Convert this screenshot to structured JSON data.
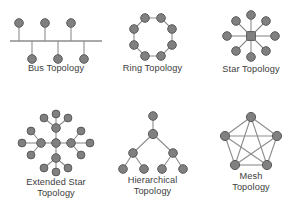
{
  "figure": {
    "background_color": "#ffffff",
    "node_fill": "#808080",
    "node_stroke": "#5a5a5a",
    "edge_color": "#8d8d8d",
    "text_color": "#3d3d3d"
  },
  "topologies": [
    {
      "id": "bus",
      "label": "Bus Topology",
      "node_count": 6,
      "description": "Six nodes attached by short stubs to a single horizontal backbone line, three above and three below.",
      "nodes_above": 3,
      "nodes_below": 3
    },
    {
      "id": "ring",
      "label": "Ring Topology",
      "node_count": 8,
      "description": "Eight nodes arranged in a closed octagonal ring, each connected to its two neighbours.",
      "edge_count": 8
    },
    {
      "id": "star",
      "label": "Star Topology",
      "node_count": 9,
      "description": "One central hub node connected by eight spokes to eight surrounding nodes.",
      "spokes": 8,
      "hub_count": 1
    },
    {
      "id": "extended-star",
      "label": "Extended Star\nTopology",
      "label_line1": "Extended Star",
      "label_line2": "Topology",
      "node_count": 17,
      "description": "A central hub connected to four inner nodes, each of which fans out to three outer nodes.",
      "inner_nodes": 4,
      "outer_per_inner": 3
    },
    {
      "id": "hierarchical",
      "label": "Hierarchical\nTopology",
      "label_line1": "Hierarchical",
      "label_line2": "Topology",
      "node_count": 7,
      "description": "A tree with a root node, one trunk node, two branch nodes and four leaf nodes.",
      "levels": 4
    },
    {
      "id": "mesh",
      "label": "Mesh\nTopology",
      "label_line1": "Mesh",
      "label_line2": "Topology",
      "node_count": 5,
      "description": "Five nodes on a pentagon, fully interconnected so every node links to every other node.",
      "edge_count": 10
    }
  ]
}
